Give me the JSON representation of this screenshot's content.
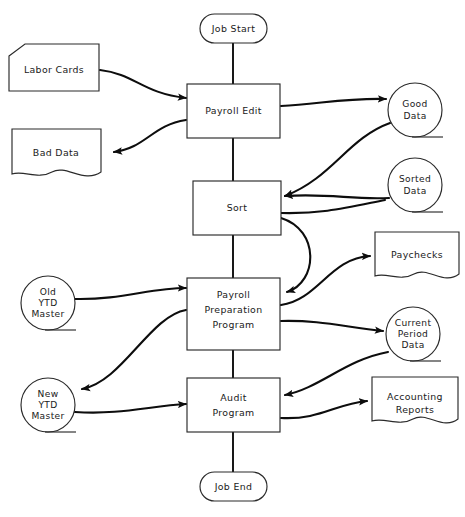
{
  "diagram": {
    "type": "system-flowchart",
    "background_color": "#ffffff",
    "line_color": "#0d0d0d",
    "outline_color": "#2a2a2a",
    "text_color": "#1a1a1a"
  },
  "nodes": {
    "job_start": {
      "label": "Job Start",
      "shape": "terminator"
    },
    "labor_cards": {
      "label": "Labor Cards",
      "shape": "punched-card"
    },
    "payroll_edit": {
      "label": "Payroll Edit",
      "shape": "process"
    },
    "bad_data": {
      "label": "Bad Data",
      "shape": "document"
    },
    "good_data": {
      "line1": "Good",
      "line2": "Data",
      "shape": "magnetic-tape"
    },
    "sort": {
      "label": "Sort",
      "shape": "process"
    },
    "sorted_data": {
      "line1": "Sorted",
      "line2": "Data",
      "shape": "magnetic-tape"
    },
    "paychecks": {
      "label": "Paychecks",
      "shape": "document"
    },
    "old_ytd_master": {
      "line1": "Old",
      "line2": "YTD",
      "line3": "Master",
      "shape": "magnetic-tape"
    },
    "payroll_preparation_program": {
      "line1": "Payroll",
      "line2": "Preparation",
      "line3": "Program",
      "shape": "process"
    },
    "current_period_data": {
      "line1": "Current",
      "line2": "Period",
      "line3": "Data",
      "shape": "magnetic-tape"
    },
    "new_ytd_master": {
      "line1": "New",
      "line2": "YTD",
      "line3": "Master",
      "shape": "magnetic-tape"
    },
    "audit_program": {
      "line1": "Audit",
      "line2": "Program",
      "shape": "process"
    },
    "accounting_reports": {
      "line1": "Accounting",
      "line2": "Reports",
      "shape": "document"
    },
    "job_end": {
      "label": "Job End",
      "shape": "terminator"
    }
  },
  "edges": [
    {
      "from": "job_start",
      "to": "payroll_edit",
      "style": "straight-vertical",
      "arrow": false
    },
    {
      "from": "labor_cards",
      "to": "payroll_edit",
      "style": "curve",
      "arrow": true
    },
    {
      "from": "payroll_edit",
      "to": "bad_data",
      "style": "curve",
      "arrow": true
    },
    {
      "from": "payroll_edit",
      "to": "good_data",
      "style": "curve",
      "arrow": true
    },
    {
      "from": "payroll_edit",
      "to": "sort",
      "style": "straight-vertical",
      "arrow": false
    },
    {
      "from": "good_data",
      "to": "sort",
      "style": "curve",
      "arrow": true
    },
    {
      "from": "sort",
      "to": "sorted_data",
      "style": "curve",
      "arrow": true
    },
    {
      "from": "sorted_data",
      "to": "sort",
      "style": "curve",
      "arrow": true
    },
    {
      "from": "sort",
      "to": "payroll_preparation_program",
      "style": "straight-vertical",
      "arrow": false
    },
    {
      "from": "sort",
      "to": "payroll_preparation_program",
      "style": "curve",
      "arrow": true
    },
    {
      "from": "old_ytd_master",
      "to": "payroll_preparation_program",
      "style": "curve",
      "arrow": true
    },
    {
      "from": "payroll_preparation_program",
      "to": "paychecks",
      "style": "curve",
      "arrow": true
    },
    {
      "from": "payroll_preparation_program",
      "to": "current_period_data",
      "style": "curve",
      "arrow": true
    },
    {
      "from": "payroll_preparation_program",
      "to": "new_ytd_master",
      "style": "curve",
      "arrow": true
    },
    {
      "from": "payroll_preparation_program",
      "to": "audit_program",
      "style": "straight-vertical",
      "arrow": false
    },
    {
      "from": "new_ytd_master",
      "to": "audit_program",
      "style": "curve",
      "arrow": true
    },
    {
      "from": "current_period_data",
      "to": "audit_program",
      "style": "curve",
      "arrow": true
    },
    {
      "from": "audit_program",
      "to": "accounting_reports",
      "style": "curve",
      "arrow": true
    },
    {
      "from": "audit_program",
      "to": "job_end",
      "style": "straight-vertical",
      "arrow": false
    }
  ]
}
